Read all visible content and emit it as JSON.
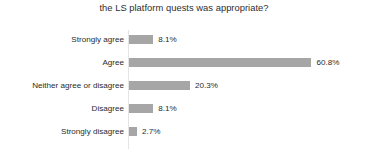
{
  "chart_data": {
    "type": "bar",
    "orientation": "horizontal",
    "title": "the LS platform quests was appropriate?",
    "xlabel": "",
    "ylabel": "",
    "grid": false,
    "legend": "none",
    "xlim": [
      0,
      65
    ],
    "bar_color": "#a6a6a6",
    "axis_color": "#e4e4e4",
    "text_color": "#2b2b2b",
    "background": "#ffffff",
    "categories": [
      "Strongly agree",
      "Agree",
      "Neither agree or disagree",
      "Disagree",
      "Strongly disagree"
    ],
    "values": [
      8.1,
      60.8,
      20.3,
      8.1,
      2.7
    ],
    "value_labels": [
      "8.1%",
      "60.8%",
      "20.3%",
      "8.1%",
      "2.7%"
    ]
  }
}
